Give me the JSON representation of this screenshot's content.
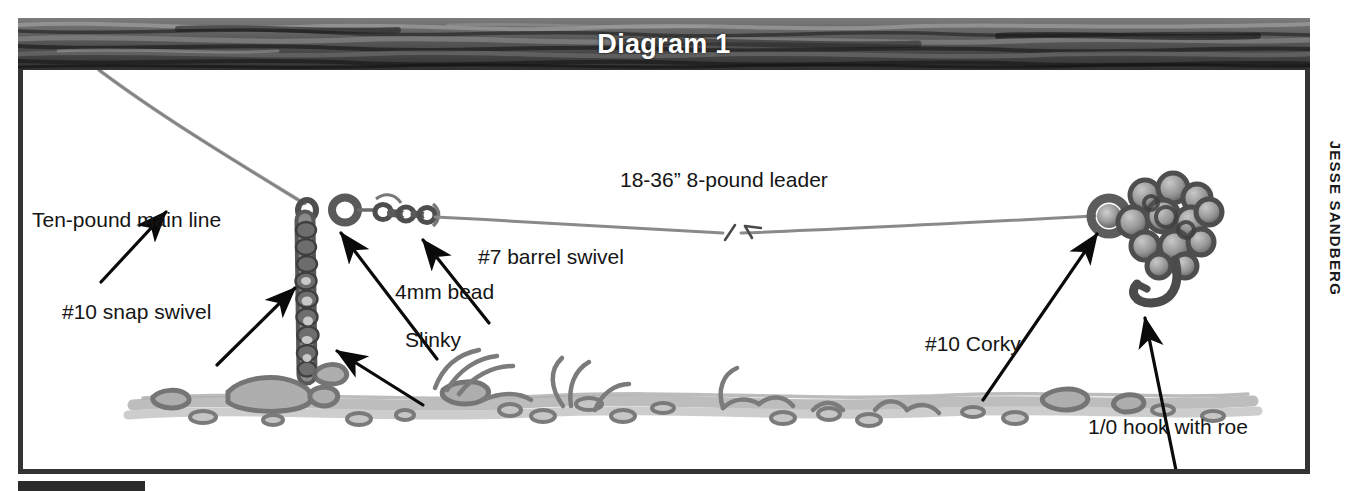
{
  "figure": {
    "title": "Diagram 1",
    "credit": "JESSE SANDBERG"
  },
  "labels": {
    "main_line": "Ten-pound main line",
    "snap_swivel": "#10 snap swivel",
    "bead": "4mm bead",
    "slinky": "Slinky",
    "barrel_swivel": "#7 barrel swivel",
    "leader": "18-36” 8-pound leader",
    "corky": "#10 Corky",
    "hook_roe": "1/0 hook with roe"
  },
  "colors": {
    "frame": "#333333",
    "banner_dark": "#3a3a3a",
    "banner_mid": "#6e6e6e",
    "banner_light": "#8f8f8f",
    "title_text": "#ffffff",
    "label_text": "#151515",
    "line_gray": "#8d8d8d",
    "tackle_dark": "#4a4a4a",
    "tackle_mid": "#7d7d7d",
    "tackle_light": "#b4b4b4",
    "gravel": "#9a9a9a",
    "arrow": "#0a0a0a",
    "background": "#ffffff"
  },
  "diagram": {
    "type": "fishing-rig-schematic",
    "components": [
      {
        "name": "main-line",
        "label": "Ten-pound main line",
        "kind": "line"
      },
      {
        "name": "snap-swivel",
        "label": "#10 snap swivel",
        "kind": "hardware"
      },
      {
        "name": "slinky-weight",
        "label": "Slinky",
        "kind": "weight"
      },
      {
        "name": "bead",
        "label": "4mm bead",
        "kind": "hardware"
      },
      {
        "name": "barrel-swivel",
        "label": "#7 barrel swivel",
        "kind": "hardware"
      },
      {
        "name": "leader",
        "label": "18-36” 8-pound leader",
        "kind": "line"
      },
      {
        "name": "corky",
        "label": "#10 Corky",
        "kind": "float"
      },
      {
        "name": "hook-with-roe",
        "label": "1/0 hook with roe",
        "kind": "terminal"
      },
      {
        "name": "riverbed",
        "label": "",
        "kind": "substrate"
      }
    ]
  }
}
